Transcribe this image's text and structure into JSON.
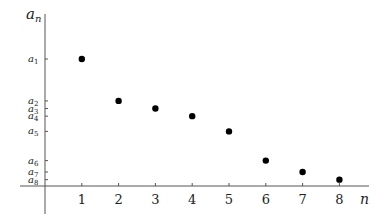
{
  "chart_data": {
    "type": "scatter",
    "title": "",
    "xlabel": "n",
    "ylabel": "a_n",
    "x": [
      1,
      2,
      3,
      4,
      5,
      6,
      7,
      8
    ],
    "series": [
      {
        "name": "a_n",
        "values": [
          1.0,
          0.67,
          0.61,
          0.55,
          0.43,
          0.2,
          0.11,
          0.05
        ]
      }
    ],
    "xticks": [
      "1",
      "2",
      "3",
      "4",
      "5",
      "6",
      "7",
      "8"
    ],
    "yticks": [
      "a1",
      "a2",
      "a3",
      "a4",
      "a5",
      "a6",
      "a7",
      "a8"
    ],
    "grid": false,
    "legend": "none",
    "note": "decreasing sequence; y values are relative positions (a1 normalized to 1)"
  },
  "axes": {
    "x_label": "n",
    "y_label_base": "a",
    "y_label_sub": "n"
  },
  "y_tick_labels": [
    {
      "base": "a",
      "sub": "1"
    },
    {
      "base": "a",
      "sub": "2"
    },
    {
      "base": "a",
      "sub": "3"
    },
    {
      "base": "a",
      "sub": "4"
    },
    {
      "base": "a",
      "sub": "5"
    },
    {
      "base": "a",
      "sub": "6"
    },
    {
      "base": "a",
      "sub": "7"
    },
    {
      "base": "a",
      "sub": "8"
    }
  ],
  "x_tick_labels": [
    "1",
    "2",
    "3",
    "4",
    "5",
    "6",
    "7",
    "8"
  ]
}
